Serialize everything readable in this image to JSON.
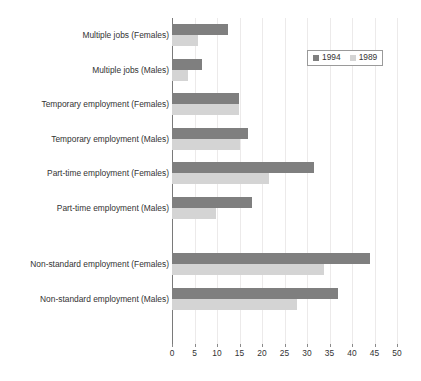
{
  "chart_data": {
    "type": "bar",
    "orientation": "horizontal",
    "title": "",
    "subtitle": "",
    "xlabel": "",
    "ylabel": "",
    "xlim": [
      0,
      50
    ],
    "xticks": [
      0,
      5,
      10,
      15,
      20,
      25,
      30,
      35,
      40,
      45,
      50
    ],
    "xtick_labels": [
      "0",
      "5",
      "10",
      "15",
      "20",
      "25",
      "30",
      "35",
      "40",
      "45",
      "50"
    ],
    "grid": true,
    "grid_axis": "x",
    "legend_position": "upper right",
    "categories": [
      "Multiple jobs (Females)",
      "Multiple jobs (Males)",
      "Temporary employment (Females)",
      "Temporary employment (Males)",
      "Part-time employment (Females)",
      "Part-time employment (Males)",
      "Non-standard employment (Females)",
      "Non-standard employment (Males)"
    ],
    "series": [
      {
        "name": "1994",
        "color": "#7f7f7f",
        "values": [
          12.4,
          6.7,
          14.8,
          16.8,
          31.5,
          17.8,
          44.0,
          36.8
        ]
      },
      {
        "name": "1989",
        "color": "#d4d4d4",
        "values": [
          5.8,
          3.6,
          14.8,
          15.0,
          21.6,
          9.7,
          33.8,
          27.8
        ]
      }
    ],
    "group_gap_after_index": 5
  },
  "legend": {
    "items": [
      {
        "label": "1994",
        "swatch": "legend-swatch-1994"
      },
      {
        "label": "1989",
        "swatch": "legend-swatch-1989"
      }
    ]
  },
  "colors": {
    "series_1994": "#7f7f7f",
    "series_1989": "#d4d4d4",
    "axis": "#7a7a7a",
    "grid": "#eceaea",
    "text": "#333333",
    "background": "#ffffff"
  }
}
